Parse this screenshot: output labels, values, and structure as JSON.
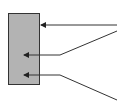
{
  "diagram": {
    "background": "#ffffff",
    "block": {
      "x": 8,
      "y": 13,
      "width": 32,
      "height": 72,
      "fill": "#b3b3b3",
      "stroke": "#333333"
    },
    "line_color": "#333333",
    "arrows": [
      {
        "name": "top-arrow",
        "points": "117,25 41,25"
      },
      {
        "name": "middle-arrow",
        "points": "117,31 60,55 24,55"
      },
      {
        "name": "bottom-arrow",
        "points": "117,100 60,75 24,75"
      }
    ]
  }
}
